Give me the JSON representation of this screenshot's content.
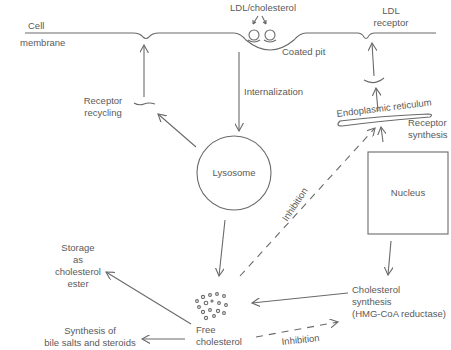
{
  "diagram": {
    "labels": {
      "cell_membrane_1": "Cell",
      "cell_membrane_2": "membrane",
      "ldl_cholesterol": "LDL/cholesterol",
      "coated_pit": "Coated pit",
      "ldl_receptor_1": "LDL",
      "ldl_receptor_2": "receptor",
      "internalization": "Internalization",
      "receptor_recycling_1": "Receptor",
      "receptor_recycling_2": "recycling",
      "lysosome": "Lysosome",
      "endoplasmic_reticulum": "Endoplasmic reticulum",
      "receptor_synthesis_1": "Receptor",
      "receptor_synthesis_2": "synthesis",
      "nucleus": "Nucleus",
      "inhibition_1": "Inhibition",
      "inhibition_2": "Inhibition",
      "storage_1": "Storage",
      "storage_2": "as",
      "storage_3": "cholesterol",
      "storage_4": "ester",
      "free_cholesterol_1": "Free",
      "free_cholesterol_2": "cholesterol",
      "chol_synthesis_1": "Cholesterol",
      "chol_synthesis_2": "synthesis",
      "chol_synthesis_3": "(HMG-CoA reductase)",
      "bile_1": "Synthesis of",
      "bile_2": "bile salts and steroids"
    },
    "nodes": [
      "Cell membrane",
      "Coated pit",
      "LDL receptor",
      "Lysosome",
      "Endoplasmic reticulum",
      "Nucleus",
      "Free cholesterol",
      "Cholesterol synthesis (HMG-CoA reductase)",
      "Storage as cholesterol ester",
      "Synthesis of bile salts and steroids"
    ],
    "edges": [
      {
        "from": "Coated pit",
        "to": "Lysosome",
        "label": "Internalization",
        "style": "solid"
      },
      {
        "from": "Lysosome",
        "to": "Receptor recycling",
        "style": "solid"
      },
      {
        "from": "Receptor recycling",
        "to": "Cell membrane",
        "style": "solid"
      },
      {
        "from": "Lysosome",
        "to": "Free cholesterol",
        "style": "solid"
      },
      {
        "from": "Free cholesterol",
        "to": "Endoplasmic reticulum",
        "label": "Inhibition",
        "style": "dashed"
      },
      {
        "from": "Endoplasmic reticulum",
        "to": "LDL receptor",
        "style": "solid"
      },
      {
        "from": "Nucleus",
        "to": "Cholesterol synthesis",
        "style": "solid"
      },
      {
        "from": "Cholesterol synthesis",
        "to": "Free cholesterol",
        "style": "solid"
      },
      {
        "from": "Free cholesterol",
        "to": "Cholesterol synthesis",
        "label": "Inhibition",
        "style": "dashed"
      },
      {
        "from": "Free cholesterol",
        "to": "Storage as cholesterol ester",
        "style": "solid"
      },
      {
        "from": "Free cholesterol",
        "to": "Synthesis of bile salts and steroids",
        "style": "solid"
      }
    ]
  }
}
